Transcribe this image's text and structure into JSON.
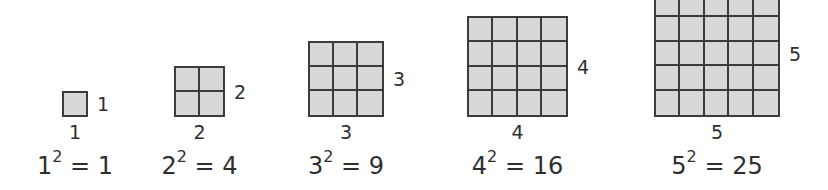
{
  "figure": {
    "colors": {
      "fill": "#d8d8d8",
      "grid_line": "#3c3c3c",
      "text": "#2e2e2e",
      "background": "#ffffff"
    },
    "cell_size_px": 25,
    "baseline_y": 117,
    "squares": [
      {
        "n": 1,
        "left": 62,
        "side_label": "1",
        "bottom_label": "1",
        "base": "1",
        "exponent": "2",
        "equals": "=",
        "result": "1"
      },
      {
        "n": 2,
        "left": 174,
        "side_label": "2",
        "bottom_label": "2",
        "base": "2",
        "exponent": "2",
        "equals": "=",
        "result": "4"
      },
      {
        "n": 3,
        "left": 308,
        "side_label": "3",
        "bottom_label": "3",
        "base": "3",
        "exponent": "2",
        "equals": "=",
        "result": "9"
      },
      {
        "n": 4,
        "left": 467,
        "side_label": "4",
        "bottom_label": "4",
        "base": "4",
        "exponent": "2",
        "equals": "=",
        "result": "16"
      },
      {
        "n": 5,
        "left": 654,
        "side_label": "5",
        "bottom_label": "5",
        "base": "5",
        "exponent": "2",
        "equals": "=",
        "result": "25"
      }
    ]
  }
}
